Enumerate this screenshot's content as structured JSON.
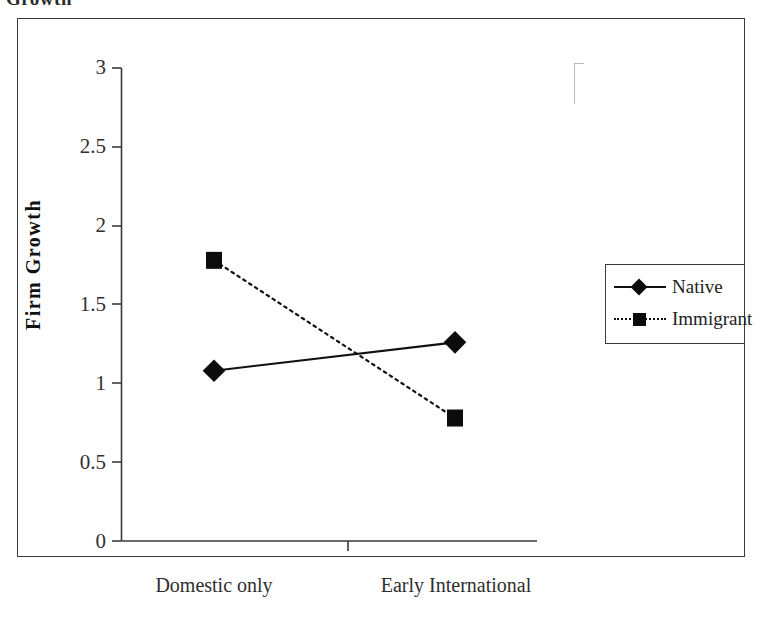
{
  "clipped_caption": "Growth",
  "legend": {
    "position": "right",
    "entries": [
      {
        "label": "Native",
        "marker": "diamond-marker-icon",
        "line": "solid"
      },
      {
        "label": "Immigrant",
        "marker": "square-marker-icon",
        "line": "dotted"
      }
    ]
  },
  "chart_data": {
    "type": "line",
    "title": "",
    "xlabel": "",
    "ylabel": "Firm Growth",
    "categories": [
      "Domestic only",
      "Early International"
    ],
    "ylim": [
      0,
      3
    ],
    "yticks": [
      "0",
      "0.5",
      "1",
      "1.5",
      "2",
      "2.5",
      "3"
    ],
    "ytick_values": [
      0,
      0.5,
      1,
      1.5,
      2,
      2.5,
      3
    ],
    "grid": false,
    "legend_position": "right",
    "series": [
      {
        "name": "Native",
        "values": [
          1.08,
          1.26
        ],
        "line": "solid",
        "marker": "diamond",
        "color": "#111111"
      },
      {
        "name": "Immigrant",
        "values": [
          1.78,
          0.78
        ],
        "line": "dotted",
        "marker": "square",
        "color": "#111111"
      }
    ]
  }
}
